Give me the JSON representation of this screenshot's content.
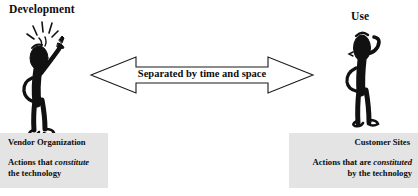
{
  "diagram": {
    "title_left": "Development",
    "title_right": "Use",
    "arrow_label": "Separated by time and space",
    "left_box": {
      "heading": "Vendor Organization",
      "line1_pre": "Actions that ",
      "line1_italic": "constitute",
      "line2": "the technology"
    },
    "right_box": {
      "heading": "Customer Sites",
      "line1_pre": "Actions that  are ",
      "line1_italic": "constituted",
      "line2": "by the technology"
    },
    "figures": {
      "left_name": "developer-stick-figure-with-idea",
      "right_name": "user-stick-figure-puzzled"
    },
    "colors": {
      "background": "#ffffff",
      "ink": "#0d0d0d",
      "box_fill": "#e4e4e4",
      "arrow_fill": "#ffffff",
      "arrow_stroke": "#1a1a1a"
    }
  }
}
